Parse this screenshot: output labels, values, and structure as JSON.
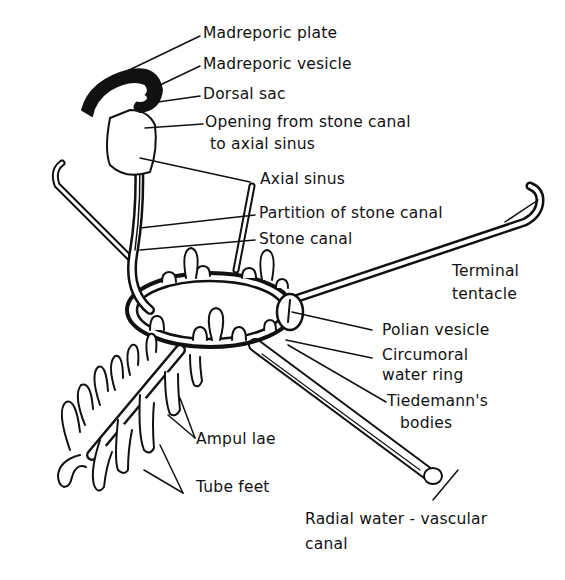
{
  "diagram": {
    "labels": {
      "madreporic_plate": "Madreporic plate",
      "madreporic_vesicle": "Madreporic vesicle",
      "dorsal_sac": "Dorsal sac",
      "opening_line1": "Opening from stone canal",
      "opening_line2": "to axial sinus",
      "axial_sinus": "Axial sinus",
      "partition": "Partition of stone canal",
      "stone_canal": "Stone canal",
      "terminal_line1": "Terminal",
      "terminal_line2": "tentacle",
      "polian_vesicle": "Polian vesicle",
      "circumoral_line1": "Circumoral",
      "circumoral_line2": "water ring",
      "tiedemann_line1": "Tiedemann's",
      "tiedemann_line2": "bodies",
      "ampullae": "Ampul lae",
      "tube_feet": "Tube feet",
      "radial_line1": "Radial water - vascular",
      "radial_line2": "canal"
    },
    "colors": {
      "ink": "#111111",
      "paper": "#ffffff"
    }
  }
}
